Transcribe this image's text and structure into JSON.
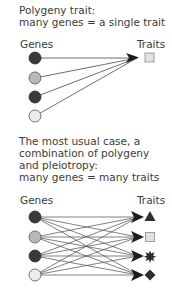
{
  "section1": {
    "title_line1": "Polygeny trait:",
    "title_line2": "many genes = a single trait",
    "genes_label": "Genes",
    "traits_label": "Traits",
    "genes": [
      {
        "name": "gene-1",
        "color": "#3a3a3a"
      },
      {
        "name": "gene-2",
        "color": "#b8b8b8"
      },
      {
        "name": "gene-3",
        "color": "#3a3a3a"
      },
      {
        "name": "gene-4",
        "color": "#ececec"
      }
    ],
    "traits": [
      {
        "name": "trait-square",
        "shape": "square",
        "color": "#e0e0e0"
      }
    ]
  },
  "section2": {
    "title_line1": "The most usual case, a",
    "title_line2": "combination of polygeny",
    "title_line3": "and pleiotropy:",
    "title_line4": "many genes = many traits",
    "genes_label": "Genes",
    "traits_label": "Traits",
    "genes": [
      {
        "name": "gene-1",
        "color": "#3a3a3a"
      },
      {
        "name": "gene-2",
        "color": "#b8b8b8"
      },
      {
        "name": "gene-3",
        "color": "#3a3a3a"
      },
      {
        "name": "gene-4",
        "color": "#ececec"
      }
    ],
    "traits": [
      {
        "name": "trait-triangle",
        "shape": "triangle",
        "color": "#2e2e2e"
      },
      {
        "name": "trait-square",
        "shape": "square",
        "color": "#e0e0e0"
      },
      {
        "name": "trait-star",
        "shape": "star",
        "color": "#2e2e2e"
      },
      {
        "name": "trait-diamond",
        "shape": "diamond",
        "color": "#2e2e2e"
      }
    ]
  }
}
